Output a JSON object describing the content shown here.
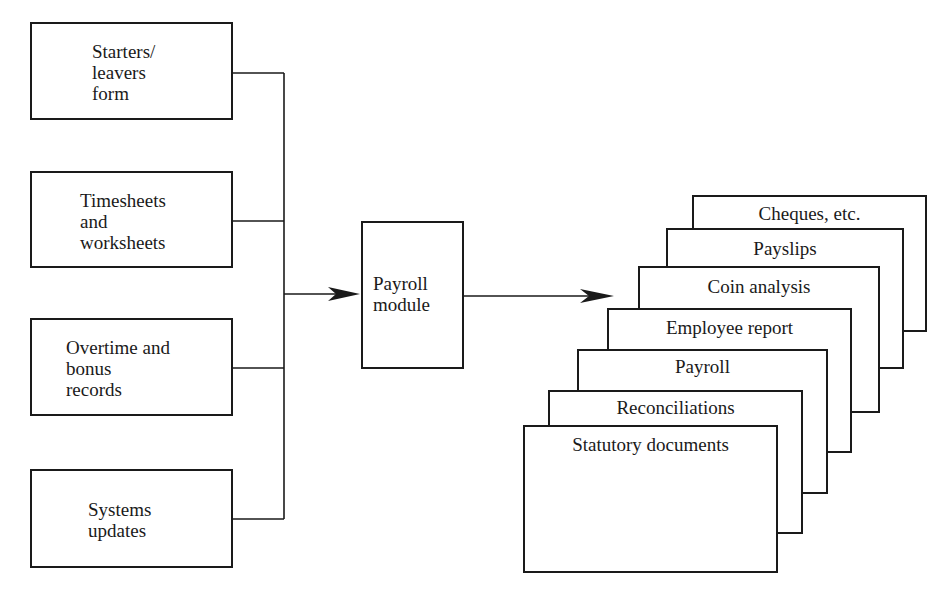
{
  "diagram": {
    "inputs": [
      {
        "label": "Starters/\nleavers\nform"
      },
      {
        "label": "Timesheets\nand\nworksheets"
      },
      {
        "label": "Overtime and\nbonus\nrecords"
      },
      {
        "label": "Systems\nupdates"
      }
    ],
    "process": {
      "label": "Payroll\nmodule"
    },
    "outputs": [
      {
        "label": "Cheques, etc."
      },
      {
        "label": "Payslips"
      },
      {
        "label": "Coin analysis"
      },
      {
        "label": "Employee report"
      },
      {
        "label": "Payroll"
      },
      {
        "label": "Reconciliations"
      },
      {
        "label": "Statutory documents"
      }
    ],
    "colors": {
      "line": "#1a1a1a",
      "background": "#ffffff"
    }
  }
}
